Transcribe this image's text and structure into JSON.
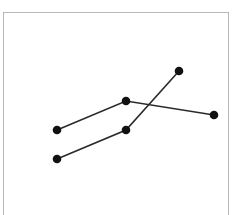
{
  "chart_data": {
    "type": "line",
    "title": "",
    "xlabel": "",
    "ylabel": "",
    "grid": false,
    "legend": null,
    "x": [
      1,
      2,
      3
    ],
    "series": [
      {
        "name": "A",
        "points": [
          [
            57,
            130
          ],
          [
            126,
            101
          ],
          [
            214,
            115
          ]
        ]
      },
      {
        "name": "B",
        "points": [
          [
            57,
            159
          ],
          [
            126,
            130
          ],
          [
            179,
            71
          ]
        ]
      }
    ],
    "colors": {
      "line": "#2a2a2a",
      "marker": "#111111",
      "frame": "#b8b8b8"
    }
  }
}
